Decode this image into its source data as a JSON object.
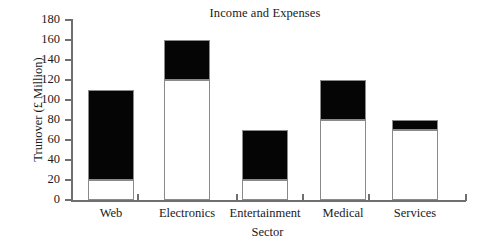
{
  "chart_data": {
    "type": "bar",
    "subtype": "stacked-bar",
    "title": "Income and Expenses",
    "xlabel": "Sector",
    "ylabel": "Trunover (£ Million)",
    "categories": [
      "Web",
      "Electronics",
      "Entertainment",
      "Medical",
      "Services"
    ],
    "series": [
      {
        "name": "lower-white-segment",
        "color": "#ffffff",
        "values": [
          20,
          120,
          20,
          80,
          70
        ]
      },
      {
        "name": "upper-black-segment",
        "color": "#050505",
        "values": [
          90,
          40,
          50,
          40,
          10
        ]
      }
    ],
    "cumulative_totals": [
      110,
      160,
      70,
      120,
      80
    ],
    "segment_boundaries": [
      20,
      120,
      20,
      80,
      70
    ],
    "ylim": [
      0,
      180
    ],
    "ytick_values": [
      0,
      20,
      40,
      60,
      80,
      100,
      120,
      140,
      160,
      180
    ],
    "ytick_labels": [
      "0",
      "20",
      "40",
      "60",
      "80",
      "100",
      "120",
      "140",
      "160",
      "180"
    ],
    "grid": false,
    "legend": "none",
    "axis_color": "#6f6f6f",
    "bar_edge_color": "#8a8a8a",
    "background": "#ffffff"
  },
  "ticks": {
    "y": [
      {
        "value": 180,
        "label": "180",
        "top": 20
      },
      {
        "value": 160,
        "label": "160",
        "top": 40
      },
      {
        "value": 140,
        "label": "140",
        "top": 60
      },
      {
        "value": 120,
        "label": "120",
        "top": 80
      },
      {
        "value": 100,
        "label": "100",
        "top": 100
      },
      {
        "value": 80,
        "label": "80",
        "top": 120
      },
      {
        "value": 60,
        "label": "60",
        "top": 140
      },
      {
        "value": 40,
        "label": "40",
        "top": 160
      },
      {
        "value": 20,
        "label": "20",
        "top": 180
      },
      {
        "value": 0,
        "label": "0",
        "top": 200
      }
    ],
    "x_positions": [
      72,
      105,
      138,
      171,
      204,
      237,
      270,
      303,
      336,
      369,
      402,
      435,
      466
    ]
  },
  "bars": [
    {
      "category": "Web",
      "left": 88,
      "width": 46,
      "lower": 20,
      "total": 110,
      "label_left": 74,
      "label_width": 74
    },
    {
      "category": "Electronics",
      "left": 164,
      "width": 46,
      "lower": 120,
      "total": 160,
      "label_left": 140,
      "label_width": 94
    },
    {
      "category": "Entertainment",
      "left": 242,
      "width": 46,
      "lower": 20,
      "total": 70,
      "label_left": 212,
      "label_width": 106
    },
    {
      "category": "Medical",
      "left": 320,
      "width": 46,
      "lower": 80,
      "total": 120,
      "label_left": 300,
      "label_width": 86
    },
    {
      "category": "Services",
      "left": 392,
      "width": 46,
      "lower": 70,
      "total": 80,
      "label_left": 372,
      "label_width": 86
    }
  ]
}
